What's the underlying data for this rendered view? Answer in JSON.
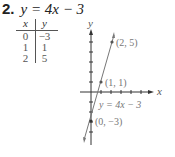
{
  "problem": {
    "number": "2.",
    "equation": "y = 4x − 3"
  },
  "table": {
    "headers": [
      "x",
      "y"
    ],
    "rows": [
      [
        "0",
        "−3"
      ],
      [
        "1",
        "1"
      ],
      [
        "2",
        "5"
      ]
    ]
  },
  "graph": {
    "x_axis_label": "x",
    "y_axis_label": "y",
    "line_label": "y = 4x − 3",
    "points": [
      {
        "label": "(2, 5)",
        "x": 2,
        "y": 5
      },
      {
        "label": "(1, 1)",
        "x": 1,
        "y": 1
      },
      {
        "label": "(0, −3)",
        "x": 0,
        "y": -3
      }
    ],
    "colors": {
      "axis": "#333333",
      "line": "#777777",
      "text": "#777777"
    }
  }
}
